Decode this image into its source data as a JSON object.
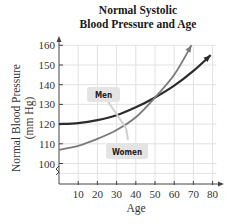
{
  "chart_data": {
    "type": "line",
    "title": "Normal Systolic Blood Pressure and Age",
    "title_lines": [
      "Normal Systolic",
      "Blood Pressure and Age"
    ],
    "xlabel": "Age",
    "ylabel": "Normal Blood Pressure (mm Hg)",
    "ylabel_lines": [
      "Normal Blood Pressure",
      "(mm Hg)"
    ],
    "xlim": [
      0,
      85
    ],
    "ylim": [
      95,
      165
    ],
    "x_ticks": [
      10,
      20,
      30,
      40,
      50,
      60,
      70,
      80
    ],
    "y_ticks": [
      100,
      110,
      120,
      130,
      140,
      150,
      160
    ],
    "grid": true,
    "axis_break_y": true,
    "series": [
      {
        "name": "Men",
        "color": "#2b2b2b",
        "x": [
          0,
          10,
          20,
          30,
          40,
          50,
          60,
          70,
          79
        ],
        "values": [
          120,
          120.5,
          122,
          124.5,
          128.5,
          133.5,
          139.5,
          147,
          155
        ]
      },
      {
        "name": "Women",
        "color": "#7a7a7a",
        "x": [
          0,
          10,
          20,
          30,
          40,
          50,
          60,
          69
        ],
        "values": [
          107,
          109,
          112.5,
          117,
          123.5,
          133.5,
          145,
          160
        ]
      }
    ],
    "annotations": [
      "Men",
      "Women"
    ]
  }
}
